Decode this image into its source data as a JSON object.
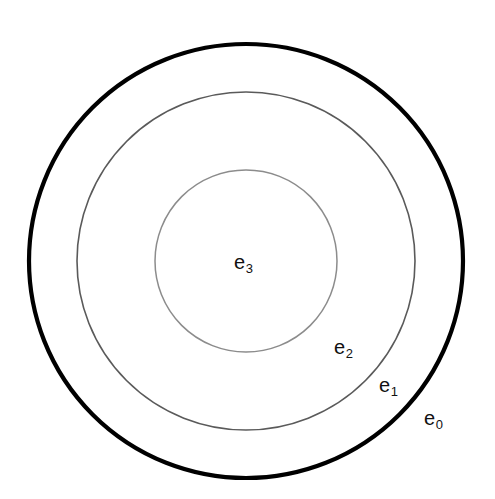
{
  "figure": {
    "type": "concentric-circles-diagram",
    "background_color": "#ffffff",
    "width": 495,
    "height": 499,
    "center": {
      "x": 246,
      "y": 261
    }
  },
  "rings": [
    {
      "id": "e0",
      "label_base": "e",
      "label_sub": "0",
      "radius": 217,
      "stroke_color": "#000000",
      "stroke_width": 4.2,
      "label_x": 437,
      "label_y": 418
    },
    {
      "id": "e1",
      "label_base": "e",
      "label_sub": "1",
      "radius": 169,
      "stroke_color": "#5a5a5a",
      "stroke_width": 1.6,
      "label_x": 392,
      "label_y": 385
    },
    {
      "id": "e2",
      "label_base": "e",
      "label_sub": "2",
      "radius": 91,
      "stroke_color": "#8c8c8c",
      "stroke_width": 1.5,
      "label_x": 347,
      "label_y": 347
    },
    {
      "id": "e3",
      "label_base": "e",
      "label_sub": "3",
      "radius": 0,
      "stroke_color": "none",
      "stroke_width": 0,
      "label_x": 247,
      "label_y": 262
    }
  ],
  "labels": {
    "e0": {
      "base": "e",
      "sub": "0"
    },
    "e1": {
      "base": "e",
      "sub": "1"
    },
    "e2": {
      "base": "e",
      "sub": "2"
    },
    "e3": {
      "base": "e",
      "sub": "3"
    }
  },
  "chart_data": {
    "type": "diagram",
    "title": "",
    "categories": [
      "e0",
      "e1",
      "e2",
      "e3"
    ],
    "values": [
      217,
      169,
      91,
      0
    ],
    "xlabel": "",
    "ylabel": "radius (px)",
    "grid": false,
    "legend": "none"
  }
}
